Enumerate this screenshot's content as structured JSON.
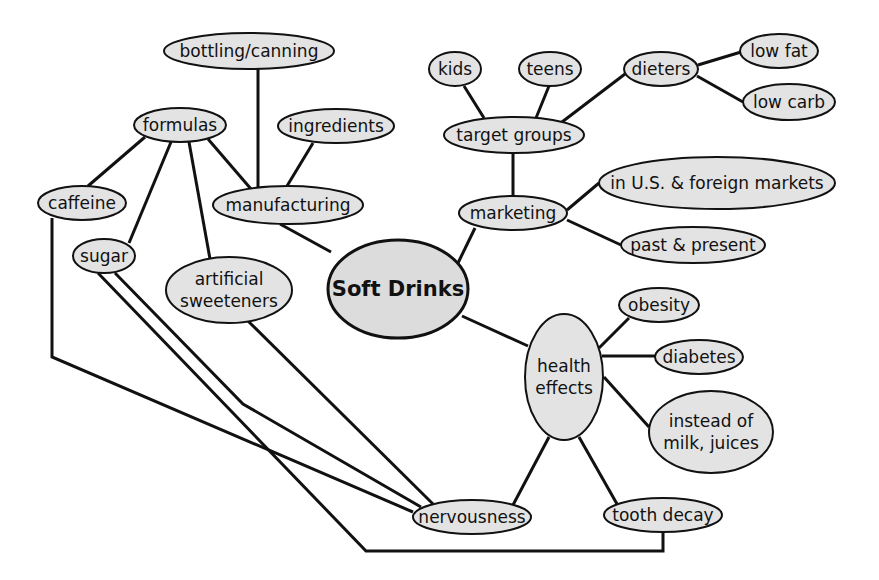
{
  "diagram": {
    "type": "concept-map",
    "title": "Soft Drinks",
    "colors": {
      "node_fill": "#e3e3e3",
      "stroke": "#111111",
      "background": "#ffffff"
    },
    "nodes": [
      {
        "id": "soft-drinks",
        "lines": [
          "Soft Drinks"
        ],
        "cx": 398,
        "cy": 289,
        "rx": 70,
        "ry": 49,
        "central": true
      },
      {
        "id": "manufacturing",
        "lines": [
          "manufacturing"
        ],
        "cx": 288,
        "cy": 205,
        "rx": 75,
        "ry": 19
      },
      {
        "id": "bottling-canning",
        "lines": [
          "bottling/canning"
        ],
        "cx": 249,
        "cy": 51,
        "rx": 85,
        "ry": 18
      },
      {
        "id": "formulas",
        "lines": [
          "formulas"
        ],
        "cx": 180,
        "cy": 125,
        "rx": 46,
        "ry": 17
      },
      {
        "id": "ingredients",
        "lines": [
          "ingredients"
        ],
        "cx": 336,
        "cy": 126,
        "rx": 58,
        "ry": 17
      },
      {
        "id": "caffeine",
        "lines": [
          "caffeine"
        ],
        "cx": 82,
        "cy": 203,
        "rx": 44,
        "ry": 17
      },
      {
        "id": "sugar",
        "lines": [
          "sugar"
        ],
        "cx": 104,
        "cy": 256,
        "rx": 31,
        "ry": 17
      },
      {
        "id": "artificial-sweeteners",
        "lines": [
          "artificial",
          "sweeteners"
        ],
        "cx": 229,
        "cy": 290,
        "rx": 63,
        "ry": 33
      },
      {
        "id": "marketing",
        "lines": [
          "marketing"
        ],
        "cx": 513,
        "cy": 213,
        "rx": 54,
        "ry": 17
      },
      {
        "id": "target-groups",
        "lines": [
          "target groups"
        ],
        "cx": 514,
        "cy": 135,
        "rx": 70,
        "ry": 18
      },
      {
        "id": "kids",
        "lines": [
          "kids"
        ],
        "cx": 455,
        "cy": 69,
        "rx": 26,
        "ry": 17
      },
      {
        "id": "teens",
        "lines": [
          "teens"
        ],
        "cx": 550,
        "cy": 69,
        "rx": 31,
        "ry": 17
      },
      {
        "id": "dieters",
        "lines": [
          "dieters"
        ],
        "cx": 661,
        "cy": 69,
        "rx": 37,
        "ry": 17
      },
      {
        "id": "low-fat",
        "lines": [
          "low fat"
        ],
        "cx": 779,
        "cy": 51,
        "rx": 39,
        "ry": 17
      },
      {
        "id": "low-carb",
        "lines": [
          "low carb"
        ],
        "cx": 789,
        "cy": 102,
        "rx": 46,
        "ry": 18
      },
      {
        "id": "us-foreign-markets",
        "lines": [
          "in U.S. & foreign markets"
        ],
        "cx": 717,
        "cy": 183,
        "rx": 118,
        "ry": 26
      },
      {
        "id": "past-present",
        "lines": [
          "past & present"
        ],
        "cx": 693,
        "cy": 245,
        "rx": 72,
        "ry": 18
      },
      {
        "id": "health-effects",
        "lines": [
          "health",
          "effects"
        ],
        "cx": 564,
        "cy": 377,
        "rx": 39,
        "ry": 63
      },
      {
        "id": "obesity",
        "lines": [
          "obesity"
        ],
        "cx": 659,
        "cy": 305,
        "rx": 40,
        "ry": 17
      },
      {
        "id": "diabetes",
        "lines": [
          "diabetes"
        ],
        "cx": 699,
        "cy": 357,
        "rx": 44,
        "ry": 17
      },
      {
        "id": "instead-of-milk-juices",
        "lines": [
          "instead of",
          "milk, juices"
        ],
        "cx": 711,
        "cy": 432,
        "rx": 62,
        "ry": 41
      },
      {
        "id": "nervousness",
        "lines": [
          "nervousness"
        ],
        "cx": 472,
        "cy": 517,
        "rx": 59,
        "ry": 17
      },
      {
        "id": "tooth-decay",
        "lines": [
          "tooth decay"
        ],
        "cx": 663,
        "cy": 515,
        "rx": 59,
        "ry": 17
      }
    ],
    "edges": [
      {
        "from": "soft-drinks",
        "to": "manufacturing",
        "points": [
          [
            331,
            252
          ],
          [
            280,
            224
          ]
        ]
      },
      {
        "from": "manufacturing",
        "to": "bottling-canning",
        "points": [
          [
            258,
            188
          ],
          [
            258,
            69
          ]
        ]
      },
      {
        "from": "manufacturing",
        "to": "ingredients",
        "points": [
          [
            287,
            186
          ],
          [
            313,
            143
          ]
        ]
      },
      {
        "from": "manufacturing",
        "to": "formulas",
        "points": [
          [
            251,
            189
          ],
          [
            208,
            139
          ]
        ]
      },
      {
        "from": "formulas",
        "to": "caffeine",
        "points": [
          [
            145,
            137
          ],
          [
            88,
            186
          ]
        ]
      },
      {
        "from": "formulas",
        "to": "sugar",
        "points": [
          [
            171,
            142
          ],
          [
            129,
            243
          ]
        ]
      },
      {
        "from": "formulas",
        "to": "artificial-sweeteners",
        "points": [
          [
            189,
            142
          ],
          [
            210,
            259
          ]
        ]
      },
      {
        "from": "soft-drinks",
        "to": "marketing",
        "points": [
          [
            458,
            263
          ],
          [
            475,
            228
          ]
        ]
      },
      {
        "from": "marketing",
        "to": "target-groups",
        "points": [
          [
            513,
            196
          ],
          [
            513,
            153
          ]
        ]
      },
      {
        "from": "target-groups",
        "to": "kids",
        "points": [
          [
            484,
            118
          ],
          [
            464,
            86
          ]
        ]
      },
      {
        "from": "target-groups",
        "to": "teens",
        "points": [
          [
            536,
            118
          ],
          [
            549,
            86
          ]
        ]
      },
      {
        "from": "target-groups",
        "to": "dieters",
        "points": [
          [
            562,
            122
          ],
          [
            625,
            74
          ]
        ]
      },
      {
        "from": "dieters",
        "to": "low-fat",
        "points": [
          [
            698,
            65
          ],
          [
            741,
            52
          ]
        ]
      },
      {
        "from": "dieters",
        "to": "low-carb",
        "points": [
          [
            697,
            76
          ],
          [
            743,
            102
          ]
        ]
      },
      {
        "from": "marketing",
        "to": "us-foreign-markets",
        "points": [
          [
            567,
            210
          ],
          [
            599,
            183
          ]
        ]
      },
      {
        "from": "marketing",
        "to": "past-present",
        "points": [
          [
            567,
            220
          ],
          [
            621,
            245
          ]
        ]
      },
      {
        "from": "soft-drinks",
        "to": "health-effects",
        "points": [
          [
            462,
            316
          ],
          [
            528,
            346
          ]
        ]
      },
      {
        "from": "health-effects",
        "to": "obesity",
        "points": [
          [
            599,
            348
          ],
          [
            629,
            318
          ]
        ]
      },
      {
        "from": "health-effects",
        "to": "diabetes",
        "points": [
          [
            602,
            356
          ],
          [
            655,
            356
          ]
        ]
      },
      {
        "from": "health-effects",
        "to": "instead-of-milk-juices",
        "points": [
          [
            604,
            377
          ],
          [
            649,
            427
          ]
        ]
      },
      {
        "from": "health-effects",
        "to": "nervousness",
        "points": [
          [
            549,
            437
          ],
          [
            513,
            505
          ]
        ]
      },
      {
        "from": "health-effects",
        "to": "tooth-decay",
        "points": [
          [
            579,
            437
          ],
          [
            617,
            504
          ]
        ]
      },
      {
        "from": "caffeine",
        "to": "nervousness",
        "points": [
          [
            52,
            218
          ],
          [
            52,
            357
          ],
          [
            413,
            512
          ]
        ]
      },
      {
        "from": "sugar",
        "to": "nervousness",
        "points": [
          [
            115,
            273
          ],
          [
            243,
            404
          ],
          [
            421,
            507
          ]
        ]
      },
      {
        "from": "sugar",
        "to": "tooth-decay",
        "points": [
          [
            98,
            273
          ],
          [
            366,
            551
          ],
          [
            663,
            551
          ],
          [
            663,
            532
          ]
        ]
      },
      {
        "from": "artificial-sweeteners",
        "to": "nervousness",
        "points": [
          [
            247,
            320
          ],
          [
            433,
            504
          ]
        ]
      }
    ]
  }
}
